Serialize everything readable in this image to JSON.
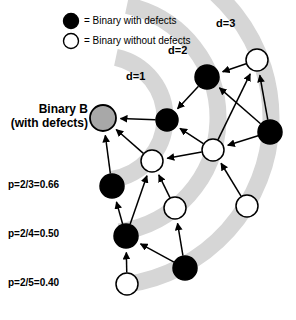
{
  "figure": {
    "type": "node-link-diagram",
    "background": "#ffffff",
    "width": 296,
    "height": 320
  },
  "legend": {
    "items": [
      {
        "marker": "filled-circle",
        "color": "#000000",
        "text": "= Binary with defects"
      },
      {
        "marker": "hollow-circle",
        "color": "#ffffff",
        "text": "= Binary without defects"
      }
    ]
  },
  "focus_node": {
    "title_line1": "Binary B",
    "title_line2": "(with defects)",
    "color": "#a8a8a8",
    "cx": 103,
    "cy": 118,
    "r": 13
  },
  "distance_labels": [
    {
      "text": "d=1",
      "x": 126,
      "y": 70
    },
    {
      "text": "d=2",
      "x": 168,
      "y": 44
    },
    {
      "text": "d=3",
      "x": 216,
      "y": 17
    }
  ],
  "probability_labels": [
    {
      "text": "p=2/3=0.66",
      "x": 8,
      "y": 179
    },
    {
      "text": "p=2/4=0.50",
      "x": 8,
      "y": 228
    },
    {
      "text": "p=2/5=0.40",
      "x": 8,
      "y": 277
    }
  ],
  "bands": {
    "color": "#d6d6d6",
    "center_x": 103,
    "center_y": 118,
    "radii": [
      62,
      115,
      168
    ],
    "stroke_width": 17
  },
  "nodes": [
    {
      "id": "B",
      "cx": 103,
      "cy": 118,
      "r": 13,
      "fill": "#a8a8a8",
      "type": "focus"
    },
    {
      "id": "n1",
      "cx": 167,
      "cy": 120,
      "r": 11,
      "fill": "#000000",
      "type": "defect"
    },
    {
      "id": "n2",
      "cx": 207,
      "cy": 77,
      "r": 12,
      "fill": "#000000",
      "type": "defect"
    },
    {
      "id": "n3",
      "cx": 257,
      "cy": 60,
      "r": 11,
      "fill": "#ffffff",
      "type": "clean"
    },
    {
      "id": "n4",
      "cx": 270,
      "cy": 132,
      "r": 12,
      "fill": "#000000",
      "type": "defect"
    },
    {
      "id": "n5",
      "cx": 213,
      "cy": 150,
      "r": 11,
      "fill": "#ffffff",
      "type": "clean"
    },
    {
      "id": "n6",
      "cx": 152,
      "cy": 161,
      "r": 11,
      "fill": "#ffffff",
      "type": "clean"
    },
    {
      "id": "n7",
      "cx": 175,
      "cy": 208,
      "r": 11,
      "fill": "#ffffff",
      "type": "clean"
    },
    {
      "id": "n8",
      "cx": 112,
      "cy": 186,
      "r": 12,
      "fill": "#000000",
      "type": "defect"
    },
    {
      "id": "n9",
      "cx": 126,
      "cy": 236,
      "r": 12,
      "fill": "#000000",
      "type": "defect"
    },
    {
      "id": "n10",
      "cx": 185,
      "cy": 268,
      "r": 12,
      "fill": "#000000",
      "type": "defect"
    },
    {
      "id": "n11",
      "cx": 127,
      "cy": 284,
      "r": 11,
      "fill": "#ffffff",
      "type": "clean"
    },
    {
      "id": "n12",
      "cx": 247,
      "cy": 206,
      "r": 11,
      "fill": "#ffffff",
      "type": "clean"
    }
  ],
  "edges": [
    {
      "from": "n1",
      "to": "B"
    },
    {
      "from": "n6",
      "to": "B"
    },
    {
      "from": "n8",
      "to": "B"
    },
    {
      "from": "n2",
      "to": "n1"
    },
    {
      "from": "n5",
      "to": "n1"
    },
    {
      "from": "n3",
      "to": "n2"
    },
    {
      "from": "n4",
      "to": "n2"
    },
    {
      "from": "n4",
      "to": "n3"
    },
    {
      "from": "n5",
      "to": "n3"
    },
    {
      "from": "n4",
      "to": "n5"
    },
    {
      "from": "n5",
      "to": "n6"
    },
    {
      "from": "n7",
      "to": "n6"
    },
    {
      "from": "n9",
      "to": "n6"
    },
    {
      "from": "n12",
      "to": "n5"
    },
    {
      "from": "n10",
      "to": "n7"
    },
    {
      "from": "n9",
      "to": "n8"
    },
    {
      "from": "n10",
      "to": "n9"
    },
    {
      "from": "n11",
      "to": "n9"
    }
  ]
}
